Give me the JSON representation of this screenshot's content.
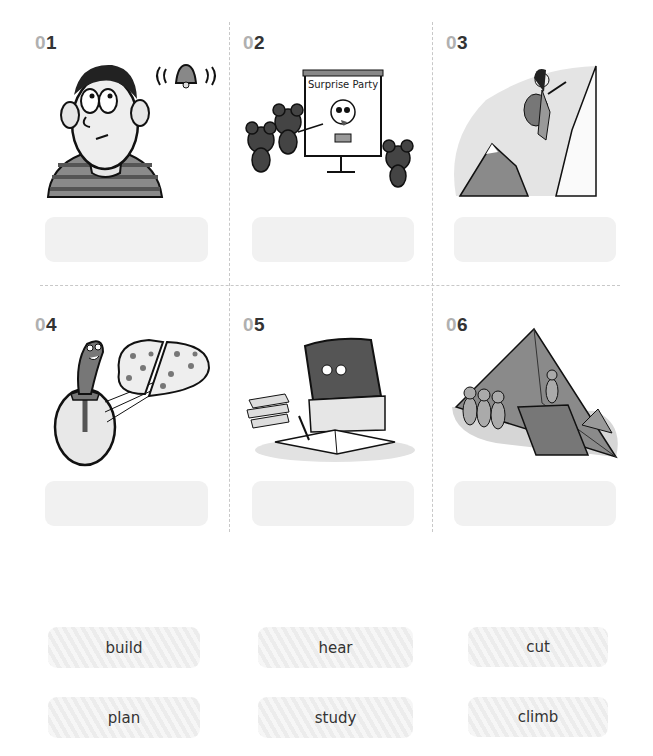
{
  "exercise": {
    "items": [
      {
        "number_prefix": "0",
        "number_digit": "1",
        "illustration": "boy-hearing-bell",
        "answer": ""
      },
      {
        "number_prefix": "0",
        "number_digit": "2",
        "illustration": "mice-planning-surprise-party",
        "board_text": "Surprise Party",
        "answer": ""
      },
      {
        "number_prefix": "0",
        "number_digit": "3",
        "illustration": "woman-climbing-mountain",
        "answer": ""
      },
      {
        "number_prefix": "0",
        "number_digit": "4",
        "illustration": "pizza-cutter-cutting-pizza",
        "answer": ""
      },
      {
        "number_prefix": "0",
        "number_digit": "5",
        "illustration": "rock-character-studying",
        "answer": ""
      },
      {
        "number_prefix": "0",
        "number_digit": "6",
        "illustration": "workers-building-pyramid",
        "answer": ""
      }
    ]
  },
  "word_bank": {
    "words": [
      "build",
      "hear",
      "cut",
      "plan",
      "study",
      "climb"
    ]
  },
  "colors": {
    "number_prefix": "#b0b0b0",
    "number_digit": "#333333",
    "answer_box": "#f1f1f1",
    "divider": "#c8c8c8"
  }
}
